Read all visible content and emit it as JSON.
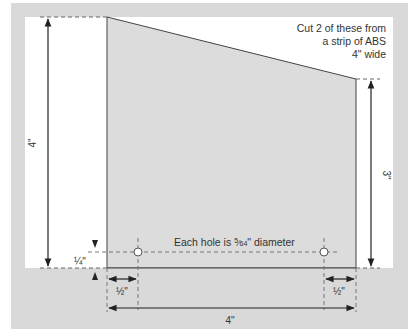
{
  "diagram": {
    "note": {
      "line1": "Cut 2 of these from",
      "line2": "a strip of ABS",
      "line3": "4\" wide"
    },
    "hole_note": "Each hole is 5/64\" diameter",
    "hole_note_prefix": "Each hole is ",
    "hole_note_fraction_num": "5",
    "hole_note_fraction_den": "64",
    "hole_note_suffix": "\" diameter",
    "dimensions": {
      "left_height": "4\"",
      "right_height": "3\"",
      "hole_offset_vertical": "¼\"",
      "hole_offset_left": "½\"",
      "hole_offset_right": "½\"",
      "bottom_width": "4\""
    },
    "colors": {
      "frame": "#d9d9d9",
      "background": "#ffffff",
      "plate": "#dcdcdc",
      "line": "#222222",
      "dash": "#777777"
    }
  }
}
